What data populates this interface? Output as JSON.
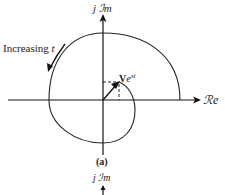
{
  "diagram": {
    "axes": {
      "imag_label": "j ℐm",
      "real_label": "ℛe"
    },
    "annotation": {
      "text": "Increasing ",
      "variable": "t"
    },
    "vector": {
      "label": "V",
      "exponent_base": "e",
      "exponent": "st"
    },
    "caption": "(a)",
    "next_panel_imag_label": "j ℐm"
  }
}
